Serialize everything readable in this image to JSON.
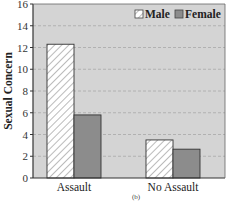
{
  "chart_data": {
    "type": "bar",
    "title": "",
    "xlabel": "",
    "ylabel": "Sexual Concern",
    "ylim": [
      0,
      16
    ],
    "yticks": [
      0,
      2,
      4,
      6,
      8,
      10,
      12,
      14,
      16
    ],
    "grid": "horizontal dashed",
    "legend_position": "top-right inside",
    "categories": [
      "Assault",
      "No Assault"
    ],
    "series": [
      {
        "name": "Male",
        "values": [
          12.3,
          3.5
        ],
        "fill": "hatched white",
        "color": "#ffffff"
      },
      {
        "name": "Female",
        "values": [
          5.8,
          2.65
        ],
        "fill": "solid gray",
        "color": "#8c8c8c"
      }
    ],
    "caption": "(b)"
  },
  "colors": {
    "plot_background": "#d4d4d4",
    "grid": "#a8a8a8",
    "axis": "#333333",
    "male_fill": "#ffffff",
    "female_fill": "#8c8c8c"
  }
}
